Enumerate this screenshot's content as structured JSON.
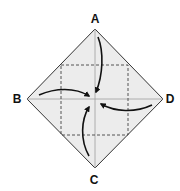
{
  "diagram": {
    "type": "origami-fold-instruction",
    "colors": {
      "paper_fill": "#ececec",
      "outline": "#333333",
      "dashed_crease": "#444444",
      "solid_crease": "#9a9a9a",
      "arrow": "#111111",
      "label": "#111111"
    },
    "vertices": {
      "A": {
        "label": "A",
        "x": 95,
        "y": 29
      },
      "B": {
        "label": "B",
        "x": 27,
        "y": 99
      },
      "C": {
        "label": "C",
        "x": 95,
        "y": 168
      },
      "D": {
        "label": "D",
        "x": 163,
        "y": 99
      }
    },
    "labels": [
      {
        "id": "A",
        "text": "A"
      },
      {
        "id": "B",
        "text": "B"
      },
      {
        "id": "C",
        "text": "C"
      },
      {
        "id": "D",
        "text": "D"
      }
    ],
    "center": {
      "x": 95,
      "y": 99
    },
    "dashed_square": {
      "left": 61,
      "top": 65,
      "right": 128,
      "bottom": 135
    },
    "arrows": [
      {
        "from": "A",
        "to": "center"
      },
      {
        "from": "B",
        "to": "center"
      },
      {
        "from": "C",
        "to": "center"
      },
      {
        "from": "D",
        "to": "center"
      }
    ]
  }
}
